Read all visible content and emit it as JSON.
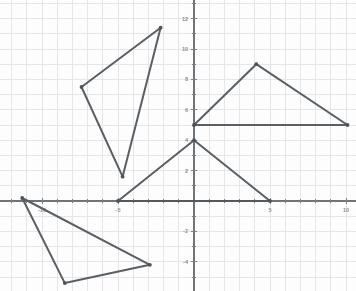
{
  "chart_data": {
    "type": "scatter",
    "title": "",
    "xlabel": "",
    "ylabel": "",
    "xlim": [
      -12.8,
      10.7
    ],
    "ylim": [
      -5.9,
      12.6
    ],
    "grid": true,
    "grid_spacing": 1,
    "legend": "none",
    "x_ticks": [
      -10,
      -5,
      5,
      10
    ],
    "x_tick_labels": [
      "-10",
      "-5",
      "5",
      "10"
    ],
    "y_ticks": [
      -4,
      -2,
      2,
      4,
      6,
      8,
      10,
      12
    ],
    "y_tick_labels": [
      "-4",
      "-2",
      "2",
      "4",
      "6",
      "8",
      "10",
      "12"
    ],
    "origin_px": {
      "x": 194,
      "y": 201
    },
    "scale_px_per_unit": 15.2,
    "series": [
      {
        "name": "triangle-upper-left",
        "closed": true,
        "points": [
          {
            "x": -2.2,
            "y": 11.4
          },
          {
            "x": -7.4,
            "y": 7.5
          },
          {
            "x": -4.7,
            "y": 1.6
          }
        ]
      },
      {
        "name": "triangle-upper-right",
        "closed": true,
        "points": [
          {
            "x": 0.0,
            "y": 5.0
          },
          {
            "x": 4.1,
            "y": 9.0
          },
          {
            "x": 10.1,
            "y": 5.0
          }
        ]
      },
      {
        "name": "triangle-middle",
        "closed": true,
        "points": [
          {
            "x": -5.0,
            "y": 0.0
          },
          {
            "x": 0.0,
            "y": 4.0
          },
          {
            "x": 5.0,
            "y": 0.0
          }
        ]
      },
      {
        "name": "triangle-lower-left",
        "closed": true,
        "points": [
          {
            "x": -11.3,
            "y": 0.2
          },
          {
            "x": -8.5,
            "y": -5.4
          },
          {
            "x": -2.9,
            "y": -4.2
          }
        ]
      }
    ]
  },
  "style": {
    "background_color": "#fdfdfd",
    "grid_color": "#e4e6ea",
    "axis_color": "#6f7478",
    "stroke_color": "#5a5f63",
    "vertex_color": "#4e5357",
    "label_color": "#8c9094"
  }
}
